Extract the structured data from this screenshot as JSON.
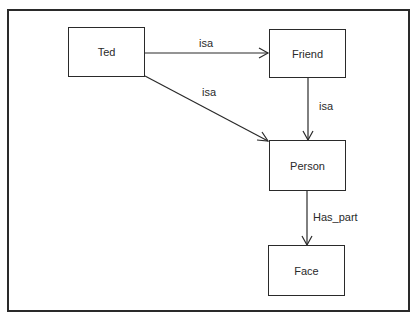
{
  "diagram": {
    "type": "semantic-network",
    "colors": {
      "stroke": "#2a2a2a",
      "background": "#ffffff"
    },
    "nodes": [
      {
        "id": "ted",
        "label": "Ted",
        "x": 68,
        "y": 27,
        "w": 77,
        "h": 50
      },
      {
        "id": "friend",
        "label": "Friend",
        "x": 269,
        "y": 29,
        "w": 77,
        "h": 49
      },
      {
        "id": "person",
        "label": "Person",
        "x": 269,
        "y": 140,
        "w": 77,
        "h": 51
      },
      {
        "id": "face",
        "label": "Face",
        "x": 268,
        "y": 245,
        "w": 77,
        "h": 51
      }
    ],
    "edges": [
      {
        "from": "ted",
        "to": "friend",
        "label": "isa"
      },
      {
        "from": "ted",
        "to": "person",
        "label": "isa"
      },
      {
        "from": "friend",
        "to": "person",
        "label": "isa"
      },
      {
        "from": "person",
        "to": "face",
        "label": "Has_part"
      }
    ]
  }
}
